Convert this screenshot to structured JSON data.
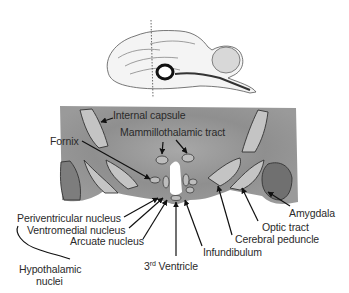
{
  "figure": {
    "top_panel": "sagittal brain view with dotted coronal section line",
    "bottom_panel": "coronal brain section through hypothalamus",
    "labels": {
      "internal_capsule": "Internal capsule",
      "mammillothalamic_tract": "Mammillothalamic tract",
      "fornix": "Fornix",
      "periventricular_nucleus": "Periventricular nucleus",
      "ventromedial_nucleus": "Ventromedial nucleus",
      "arcuate_nucleus": "Arcuate nucleus",
      "hypothalamic_nuclei_line1": "Hypothalamic",
      "hypothalamic_nuclei_line2": "nuclei",
      "third_ventricle_prefix": "3",
      "third_ventricle_sup": "rd",
      "third_ventricle_suffix": " Ventricle",
      "infundibulum": "Infundibulum",
      "cerebral_peduncle": "Cerebral peduncle",
      "optic_tract": "Optic tract",
      "amygdala": "Amygdala"
    },
    "colors": {
      "section_gray": "#8e8e8e",
      "section_light": "#b5b5b5",
      "outline": "#333333",
      "text": "#2a2a2a"
    }
  }
}
